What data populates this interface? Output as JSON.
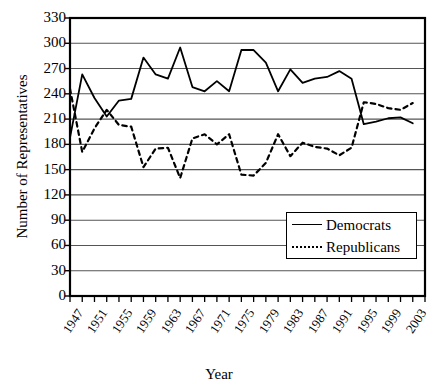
{
  "chart_data": {
    "type": "line",
    "title": "",
    "xlabel": "Year",
    "ylabel": "Number of Representatives",
    "ylim": [
      0,
      330
    ],
    "ytick_values": [
      0,
      30,
      60,
      90,
      120,
      150,
      180,
      210,
      240,
      270,
      300,
      330
    ],
    "ytick_labels": [
      "0",
      "30",
      "60",
      "90",
      "120",
      "150",
      "180",
      "210",
      "240",
      "270",
      "300",
      "330"
    ],
    "xlim": [
      1947,
      2005
    ],
    "xtick_labels": [
      "1947",
      "1951",
      "1955",
      "1959",
      "1963",
      "1967",
      "1971",
      "1975",
      "1979",
      "1983",
      "1987",
      "1991",
      "1995",
      "1999",
      "2003"
    ],
    "xtick_values": [
      1947,
      1951,
      1955,
      1959,
      1963,
      1967,
      1971,
      1975,
      1979,
      1983,
      1987,
      1991,
      1995,
      1999,
      2003
    ],
    "minor_xticks_every": 2,
    "grid": "horizontal",
    "legend_position": "inside-right-lower",
    "x": [
      1947,
      1949,
      1951,
      1953,
      1955,
      1957,
      1959,
      1961,
      1963,
      1965,
      1967,
      1969,
      1971,
      1973,
      1975,
      1977,
      1979,
      1981,
      1983,
      1985,
      1987,
      1989,
      1991,
      1993,
      1995,
      1997,
      1999,
      2001,
      2003
    ],
    "series": [
      {
        "name": "Democrats",
        "style": "solid",
        "color": "#000000",
        "values": [
          188,
          263,
          235,
          213,
          232,
          234,
          283,
          263,
          258,
          295,
          248,
          243,
          255,
          243,
          292,
          292,
          277,
          243,
          269,
          253,
          258,
          260,
          267,
          258,
          204,
          207,
          211,
          212,
          205
        ]
      },
      {
        "name": "Republicans",
        "style": "dashed",
        "color": "#000000",
        "values": [
          246,
          171,
          199,
          221,
          203,
          201,
          153,
          175,
          176,
          140,
          187,
          192,
          180,
          192,
          144,
          143,
          158,
          192,
          166,
          182,
          177,
          175,
          167,
          176,
          230,
          228,
          223,
          221,
          229
        ]
      }
    ]
  },
  "legend": {
    "items": [
      {
        "label": "Democrats",
        "style": "solid"
      },
      {
        "label": "Republicans",
        "style": "dashed"
      }
    ]
  }
}
